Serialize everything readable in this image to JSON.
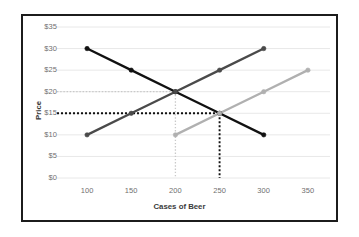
{
  "chart_data": {
    "type": "line",
    "title": "",
    "subtitle": "",
    "xlabel": "Cases of Beer",
    "ylabel": "Price",
    "xlim": [
      75,
      375
    ],
    "ylim": [
      0,
      35
    ],
    "xticks": [
      100,
      150,
      200,
      250,
      300,
      350
    ],
    "xticklabels": [
      "100",
      "150",
      "200",
      "250",
      "300",
      "350"
    ],
    "yticks": [
      0,
      5,
      10,
      15,
      20,
      25,
      30,
      35
    ],
    "yticklabels": [
      "$0",
      "$5",
      "$10",
      "$15",
      "$20",
      "$25",
      "$30",
      "$35"
    ],
    "grid": true,
    "grid_axis": "y",
    "legend": false,
    "legend_position": "none",
    "series": [
      {
        "name": "Demand",
        "color": "#111111",
        "style": "solid",
        "marker": "circle",
        "x": [
          100,
          150,
          200,
          250,
          300
        ],
        "values": [
          30,
          25,
          20,
          15,
          10
        ]
      },
      {
        "name": "Supply 1",
        "color": "#4a4a4a",
        "style": "solid",
        "marker": "circle",
        "x": [
          100,
          150,
          200,
          250,
          300
        ],
        "values": [
          10,
          15,
          20,
          25,
          30
        ]
      },
      {
        "name": "Supply 2",
        "color": "#b0b0b0",
        "style": "solid",
        "marker": "circle",
        "x": [
          200,
          250,
          300,
          350
        ],
        "values": [
          10,
          15,
          20,
          25
        ]
      }
    ],
    "annotations": [
      {
        "name": "equilibrium-1",
        "x": 200,
        "y": 20,
        "guide_color": "#c9c9c9",
        "guide_style": "dotted",
        "label": ""
      },
      {
        "name": "equilibrium-2",
        "x": 250,
        "y": 15,
        "guide_color": "#111111",
        "guide_style": "dotted",
        "label": ""
      }
    ]
  },
  "axes": {
    "y_title": "Price",
    "x_title": "Cases of Beer"
  },
  "colors": {
    "frame": "#1c1c1c",
    "gridline": "#e8e8e8",
    "tick_text": "#6f6f6f",
    "axis_title": "#3a3a3a",
    "background": "#ffffff",
    "demand": "#111111",
    "supply1": "#4a4a4a",
    "supply2": "#b0b0b0",
    "guide_light": "#c9c9c9",
    "guide_dark": "#111111"
  }
}
